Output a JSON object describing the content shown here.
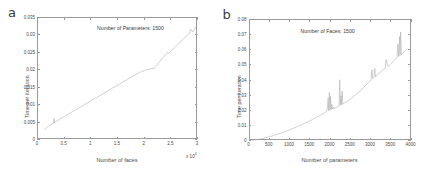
{
  "figure": {
    "background": "#ffffff",
    "axis_color": "#9a9a9a",
    "curve_color": "#a8a8a8",
    "text_color": "#4a4a4a"
  },
  "panels": [
    {
      "letter": "a",
      "annotation": "Number of Parameters: 1500",
      "xlabel": "Number of faces",
      "ylabel": "Time per iteration",
      "x_exponent": "x 10",
      "x_exponent_power": "4",
      "xticks": [
        "0",
        "0.5",
        "1",
        "1.5",
        "2",
        "2.5",
        "3"
      ],
      "yticks": [
        "0",
        "0.005",
        "0.01",
        "0.015",
        "0.02",
        "0.025",
        "0.03",
        "0.035"
      ]
    },
    {
      "letter": "b",
      "annotation": "Number of Faces: 1500",
      "xlabel": "Number of parameters",
      "ylabel": "Time per iteration",
      "x_exponent": "",
      "x_exponent_power": "",
      "xticks": [
        "0",
        "500",
        "1000",
        "1500",
        "2000",
        "2500",
        "3000",
        "3500",
        "4000"
      ],
      "yticks": [
        "0",
        "0.01",
        "0.02",
        "0.03",
        "0.04",
        "0.05",
        "0.06",
        "0.07",
        "0.08"
      ]
    }
  ],
  "chart_data": [
    {
      "type": "line",
      "panel": "a",
      "title": "",
      "annotation": "Number of Parameters: 1500",
      "xlabel": "Number of faces",
      "ylabel": "Time per iteration",
      "xlim": [
        0,
        30000
      ],
      "ylim": [
        0,
        0.035
      ],
      "x_tick_values": [
        0,
        5000,
        10000,
        15000,
        20000,
        25000,
        30000
      ],
      "y_tick_values": [
        0,
        0.005,
        0.01,
        0.015,
        0.02,
        0.025,
        0.03,
        0.035
      ],
      "x_axis_multiplier": 10000,
      "grid": false,
      "legend": false,
      "series": [
        {
          "name": "time per iteration vs number of faces",
          "x": [
            1200,
            1800,
            2400,
            2900,
            3000,
            3050,
            3100,
            3600,
            4200,
            5000,
            6000,
            7000,
            8000,
            9000,
            10000,
            11000,
            12000,
            13000,
            14000,
            15000,
            16000,
            17000,
            18000,
            19000,
            20000,
            21000,
            21800,
            22200,
            22600,
            23200,
            23800,
            24200,
            24500,
            25000,
            25600,
            26200,
            26800,
            27400,
            28000,
            28400,
            28600,
            29000,
            29400,
            29800
          ],
          "y": [
            0.003,
            0.0038,
            0.0044,
            0.0049,
            0.0062,
            0.0048,
            0.005,
            0.0055,
            0.0061,
            0.0068,
            0.0077,
            0.0086,
            0.0095,
            0.0104,
            0.0113,
            0.0122,
            0.0131,
            0.014,
            0.0149,
            0.0158,
            0.0167,
            0.0176,
            0.0185,
            0.0193,
            0.02,
            0.0204,
            0.0206,
            0.0212,
            0.0221,
            0.0232,
            0.0243,
            0.0251,
            0.0249,
            0.0256,
            0.0265,
            0.0274,
            0.0283,
            0.0292,
            0.03,
            0.0306,
            0.0318,
            0.031,
            0.0319,
            0.033
          ]
        }
      ]
    },
    {
      "type": "line",
      "panel": "b",
      "title": "",
      "annotation": "Number of Faces: 1500",
      "xlabel": "Number of parameters",
      "ylabel": "Time per iteration",
      "xlim": [
        0,
        4000
      ],
      "ylim": [
        0,
        0.08
      ],
      "x_tick_values": [
        0,
        500,
        1000,
        1500,
        2000,
        2500,
        3000,
        3500,
        4000
      ],
      "y_tick_values": [
        0,
        0.01,
        0.02,
        0.03,
        0.04,
        0.05,
        0.06,
        0.07,
        0.08
      ],
      "grid": false,
      "legend": false,
      "series": [
        {
          "name": "time per iteration vs number of parameters",
          "x": [
            50,
            150,
            250,
            350,
            450,
            550,
            650,
            750,
            850,
            950,
            1050,
            1150,
            1250,
            1350,
            1450,
            1550,
            1650,
            1750,
            1850,
            1900,
            1930,
            1945,
            1960,
            1975,
            1990,
            2005,
            2020,
            2040,
            2060,
            2080,
            2100,
            2120,
            2150,
            2180,
            2200,
            2215,
            2230,
            2245,
            2260,
            2275,
            2290,
            2310,
            2330,
            2360,
            2400,
            2450,
            2500,
            2550,
            2600,
            2650,
            2700,
            2750,
            2800,
            2850,
            2900,
            2950,
            2990,
            3010,
            3030,
            3060,
            3080,
            3100,
            3120,
            3140,
            3160,
            3200,
            3250,
            3300,
            3340,
            3360,
            3400,
            3440,
            3480,
            3520,
            3560,
            3600,
            3630,
            3650,
            3670,
            3690,
            3705,
            3720,
            3740,
            3760,
            3780,
            3800,
            3820,
            3840,
            3860
          ],
          "y": [
            0.0003,
            0.0008,
            0.0013,
            0.0019,
            0.0026,
            0.0034,
            0.0042,
            0.0051,
            0.0061,
            0.0071,
            0.0082,
            0.0093,
            0.0105,
            0.0117,
            0.013,
            0.0143,
            0.0157,
            0.0172,
            0.0188,
            0.0196,
            0.0285,
            0.02,
            0.032,
            0.0204,
            0.0295,
            0.0207,
            0.024,
            0.0211,
            0.0225,
            0.0214,
            0.0218,
            0.0221,
            0.0224,
            0.0228,
            0.0232,
            0.0405,
            0.0236,
            0.03,
            0.024,
            0.033,
            0.0243,
            0.0247,
            0.0251,
            0.0255,
            0.0262,
            0.0272,
            0.0282,
            0.0293,
            0.0304,
            0.0316,
            0.0328,
            0.034,
            0.0353,
            0.0366,
            0.038,
            0.0394,
            0.0406,
            0.047,
            0.0412,
            0.0418,
            0.048,
            0.0424,
            0.043,
            0.0436,
            0.0442,
            0.045,
            0.0462,
            0.0474,
            0.0484,
            0.054,
            0.0492,
            0.0501,
            0.0511,
            0.0521,
            0.0532,
            0.0543,
            0.0552,
            0.064,
            0.0558,
            0.069,
            0.0564,
            0.072,
            0.057,
            0.0576,
            0.0582,
            0.0588,
            0.0594,
            0.06,
            0.0606
          ]
        }
      ]
    }
  ]
}
